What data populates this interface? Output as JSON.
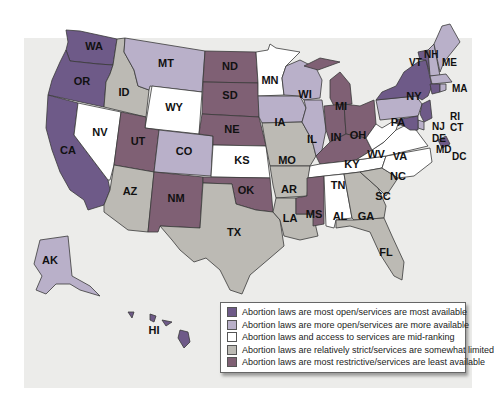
{
  "legend": {
    "items": [
      {
        "key": "most_open",
        "label": "Abortion laws are most open/services are most available",
        "color": "#6e5a88"
      },
      {
        "key": "more_open",
        "label": "Abortion laws are more open/services are more available",
        "color": "#b9b0c9"
      },
      {
        "key": "mid",
        "label": "Abortion laws and access to services are mid-ranking",
        "color": "#ffffff"
      },
      {
        "key": "strict",
        "label": "Abortion laws are relatively strict/services are somewhat limited",
        "color": "#bcbab4"
      },
      {
        "key": "most_restrictive",
        "label": "Abortion laws are most restrictive/services are least available",
        "color": "#7f6074"
      }
    ]
  },
  "states": {
    "WA": "most_open",
    "OR": "most_open",
    "CA": "most_open",
    "NY": "most_open",
    "VT": "most_open",
    "NJ": "most_open",
    "MD": "most_open",
    "DC": "most_open",
    "HI": "most_open",
    "CT": "most_open",
    "MT": "more_open",
    "ID": "strict",
    "WI": "more_open",
    "IL": "more_open",
    "IA": "more_open",
    "MO": "strict",
    "PA": "more_open",
    "ME": "more_open",
    "MA": "more_open",
    "RI": "more_open",
    "NH": "more_open",
    "CO": "more_open",
    "AZ": "strict",
    "AK": "more_open",
    "DE": "more_open",
    "WY": "mid",
    "NV": "mid",
    "MN": "mid",
    "KS": "mid",
    "WV": "mid",
    "VA": "mid",
    "NC": "mid",
    "TN": "mid",
    "AL": "mid",
    "AR": "strict",
    "LA": "strict",
    "TX": "strict",
    "GA": "strict",
    "SC": "strict",
    "FL": "strict",
    "UT": "most_restrictive",
    "NM": "most_restrictive",
    "ND": "most_restrictive",
    "SD": "most_restrictive",
    "NE": "most_restrictive",
    "OK": "most_restrictive",
    "MI": "most_restrictive",
    "IN": "most_restrictive",
    "OH": "most_restrictive",
    "KY": "most_restrictive",
    "MS": "most_restrictive"
  },
  "labels": {
    "WA": "WA",
    "OR": "OR",
    "CA": "CA",
    "ID": "ID",
    "NV": "NV",
    "MT": "MT",
    "WY": "WY",
    "UT": "UT",
    "CO": "CO",
    "AZ": "AZ",
    "NM": "NM",
    "ND": "ND",
    "SD": "SD",
    "NE": "NE",
    "KS": "KS",
    "OK": "OK",
    "TX": "TX",
    "MN": "MN",
    "IA": "IA",
    "MO": "MO",
    "AR": "AR",
    "LA": "LA",
    "WI": "WI",
    "IL": "IL",
    "MI": "MI",
    "IN": "IN",
    "OH": "OH",
    "KY": "KY",
    "TN": "TN",
    "MS": "MS",
    "AL": "AL",
    "GA": "GA",
    "FL": "FL",
    "SC": "SC",
    "NC": "NC",
    "VA": "VA",
    "WV": "WV",
    "PA": "PA",
    "NY": "NY",
    "VT": "VT",
    "NH": "NH",
    "ME": "ME",
    "MA": "MA",
    "RI": "RI",
    "CT": "CT",
    "NJ": "NJ",
    "DE": "DE",
    "MD": "MD",
    "DC": "DC",
    "AK": "AK",
    "HI": "HI"
  }
}
